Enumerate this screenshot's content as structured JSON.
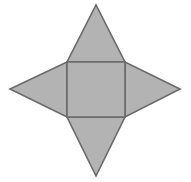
{
  "figure": {
    "name": "square-pyramid-net",
    "background_color": "#ffffff",
    "fill_color": "#b3b3b3",
    "stroke_color": "#6a6a6a",
    "stroke_width": 1.6,
    "canvas": {
      "width": 191,
      "height": 182
    },
    "square": {
      "name": "base-square",
      "left": 67,
      "top": 62,
      "right": 125,
      "bottom": 117,
      "width": 58,
      "height": 55,
      "points": "67,62 125,62 125,117 67,117"
    },
    "apex_points": {
      "top": {
        "x": 96,
        "y": 5
      },
      "right": {
        "x": 180,
        "y": 89
      },
      "bottom": {
        "x": 96,
        "y": 176
      },
      "left": {
        "x": 10,
        "y": 89
      }
    },
    "triangles": [
      {
        "name": "top-triangle",
        "points": "67,62 125,62 96,5",
        "apex_label": "top"
      },
      {
        "name": "right-triangle",
        "points": "125,62 125,117 180,89",
        "apex_label": "right"
      },
      {
        "name": "bottom-triangle",
        "points": "67,117 125,117 96,176",
        "apex_label": "bottom"
      },
      {
        "name": "left-triangle",
        "points": "67,62 67,117 10,89",
        "apex_label": "left"
      }
    ]
  }
}
